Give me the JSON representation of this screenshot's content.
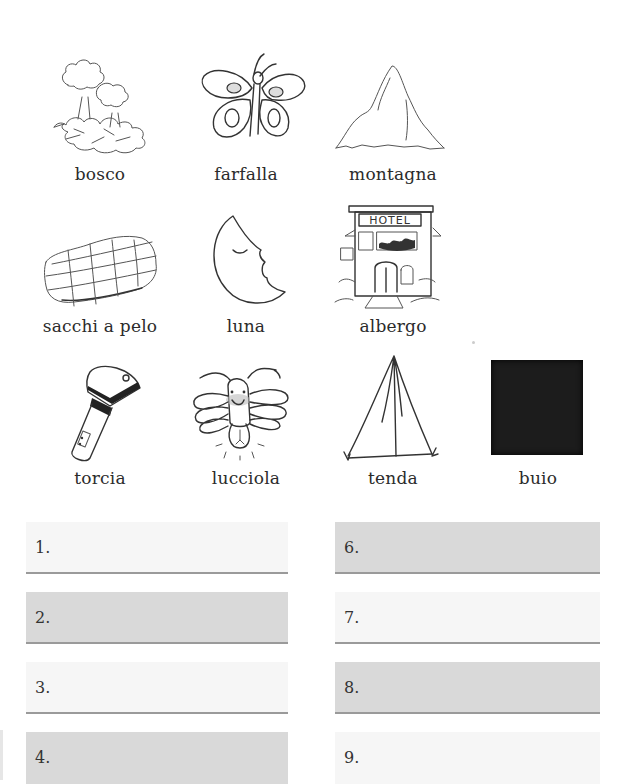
{
  "vocabulary": {
    "items": [
      {
        "label": "bosco",
        "icon": "forest-icon"
      },
      {
        "label": "farfalla",
        "icon": "butterfly-icon"
      },
      {
        "label": "montagna",
        "icon": "mountain-icon"
      },
      {
        "label": "sacchi a pelo",
        "icon": "sleeping-bag-icon"
      },
      {
        "label": "luna",
        "icon": "moon-icon"
      },
      {
        "label": "albergo",
        "icon": "hotel-icon",
        "sign_text": "HOTEL"
      },
      {
        "label": "torcia",
        "icon": "flashlight-icon"
      },
      {
        "label": "lucciola",
        "icon": "firefly-icon"
      },
      {
        "label": "tenda",
        "icon": "tent-icon"
      },
      {
        "label": "buio",
        "icon": "dark-square-icon"
      }
    ]
  },
  "answers": {
    "left": [
      {
        "number": "1.",
        "shade": "light"
      },
      {
        "number": "2.",
        "shade": "dark"
      },
      {
        "number": "3.",
        "shade": "light"
      },
      {
        "number": "4.",
        "shade": "dark"
      }
    ],
    "right": [
      {
        "number": "6.",
        "shade": "dark"
      },
      {
        "number": "7.",
        "shade": "light"
      },
      {
        "number": "8.",
        "shade": "dark"
      },
      {
        "number": "9.",
        "shade": "light"
      }
    ]
  },
  "colors": {
    "light_box": "#f6f6f6",
    "dark_box": "#d9d9d9",
    "rule": "#9a9a9a",
    "dark_square": "#1c1c1c"
  }
}
